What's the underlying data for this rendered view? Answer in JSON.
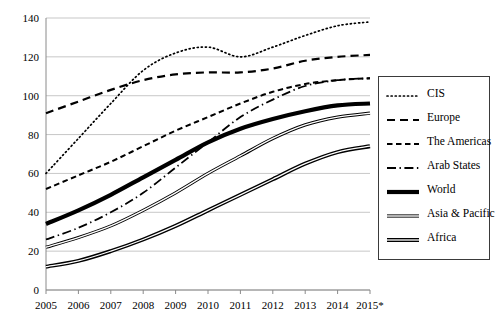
{
  "chart_data": {
    "type": "line",
    "title": "",
    "xlabel": "",
    "ylabel": "",
    "x": [
      "2005",
      "2006",
      "2007",
      "2008",
      "2009",
      "2010",
      "2011",
      "2012",
      "2013",
      "2014",
      "2015*"
    ],
    "xlim": [
      2005,
      2015
    ],
    "ylim": [
      0,
      140
    ],
    "yticks": [
      0,
      20,
      40,
      60,
      80,
      100,
      120,
      140
    ],
    "xticks": [
      "2005",
      "2006",
      "2007",
      "2008",
      "2009",
      "2010",
      "2011",
      "2012",
      "2013",
      "2014",
      "2015*"
    ],
    "grid": "horizontal",
    "legend_position": "right",
    "note": "2015 values are estimates, marked with asterisk",
    "series": [
      {
        "name": "CIS",
        "style": "dotted",
        "values": [
          60,
          78,
          96,
          113,
          122,
          125,
          120,
          125,
          131,
          136,
          138
        ]
      },
      {
        "name": "Europe",
        "style": "dashed-long",
        "values": [
          91,
          97,
          103,
          108,
          111,
          112,
          112,
          114,
          118,
          120,
          121
        ]
      },
      {
        "name": "The Americas",
        "style": "dashed",
        "values": [
          52,
          59,
          66,
          74,
          82,
          89,
          96,
          102,
          106,
          108,
          109
        ]
      },
      {
        "name": "Arab States",
        "style": "dash-dot",
        "values": [
          26,
          32,
          40,
          50,
          63,
          76,
          89,
          98,
          105,
          108,
          109
        ]
      },
      {
        "name": "World",
        "style": "thick-solid",
        "values": [
          34,
          41,
          49,
          58,
          67,
          76,
          83,
          88,
          92,
          95,
          96
        ]
      },
      {
        "name": "Asia & Pacific",
        "style": "double-line",
        "values": [
          22,
          27,
          33,
          41,
          50,
          60,
          69,
          78,
          85,
          89,
          91
        ]
      },
      {
        "name": "Africa",
        "style": "double-line-bold",
        "values": [
          12,
          15,
          20,
          26,
          33,
          41,
          49,
          57,
          65,
          71,
          74
        ]
      }
    ]
  },
  "legend": {
    "items": [
      {
        "label": "CIS"
      },
      {
        "label": "Europe"
      },
      {
        "label": "The Americas"
      },
      {
        "label": "Arab States"
      },
      {
        "label": "World"
      },
      {
        "label": "Asia & Pacific"
      },
      {
        "label": "Africa"
      }
    ]
  }
}
